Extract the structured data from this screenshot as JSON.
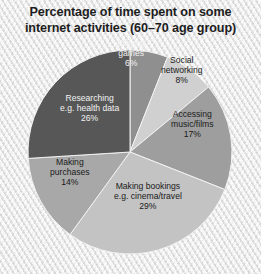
{
  "title": {
    "line1": "Percentage of time spent on some",
    "line2": "internet activities (60–70 age group)"
  },
  "chart_data": {
    "type": "pie",
    "title": "Percentage of time spent on some internet activities (60–70 age group)",
    "subtitle": "",
    "xlabel": "",
    "ylabel": "",
    "unit": "%",
    "total": 100,
    "legend": "none (labels placed on slices)",
    "grid": false,
    "start_angle_deg_from_12oclock": 0,
    "direction": "clockwise",
    "categories": [
      "Playing games",
      "Social networking",
      "Accessing music/films",
      "Making bookings e.g. cinema/travel",
      "Making purchases",
      "Researching e.g. health data"
    ],
    "values": [
      6,
      8,
      17,
      29,
      14,
      26
    ],
    "colors": [
      "#8f8f8f",
      "#d0d0d0",
      "#9e9e9e",
      "#c3c3c3",
      "#a8a8a8",
      "#575757"
    ],
    "slices": [
      {
        "name": "Playing games",
        "value": 6,
        "value_label": "6%",
        "color": "#8f8f8f",
        "text_color": "light",
        "label_lines": [
          "Playing",
          "games",
          "6%"
        ],
        "label_x": 131,
        "label_y": 53
      },
      {
        "name": "Social networking",
        "value": 8,
        "value_label": "8%",
        "color": "#d0d0d0",
        "text_color": "dark",
        "label_lines": [
          "Social",
          "networking",
          "8%"
        ],
        "label_x": 182,
        "label_y": 70
      },
      {
        "name": "Accessing music/films",
        "value": 17,
        "value_label": "17%",
        "color": "#9e9e9e",
        "text_color": "dark",
        "label_lines": [
          "Accessing",
          "music/films",
          "17%"
        ],
        "label_x": 192,
        "label_y": 124
      },
      {
        "name": "Making bookings e.g. cinema/travel",
        "value": 29,
        "value_label": "29%",
        "color": "#c3c3c3",
        "text_color": "dark",
        "label_lines": [
          "Making bookings",
          "e.g. cinema/travel",
          "29%"
        ],
        "label_x": 148,
        "label_y": 196
      },
      {
        "name": "Making purchases",
        "value": 14,
        "value_label": "14%",
        "color": "#a8a8a8",
        "text_color": "dark",
        "label_lines": [
          "Making",
          "purchases",
          "14%"
        ],
        "label_x": 70,
        "label_y": 172
      },
      {
        "name": "Researching e.g. health data",
        "value": 26,
        "value_label": "26%",
        "color": "#575757",
        "text_color": "light",
        "label_lines": [
          "Researching",
          "e.g. health data",
          "26%"
        ],
        "label_x": 89,
        "label_y": 108
      }
    ],
    "geometry": {
      "center_x": 130,
      "center_y": 152,
      "radius": 102
    }
  }
}
